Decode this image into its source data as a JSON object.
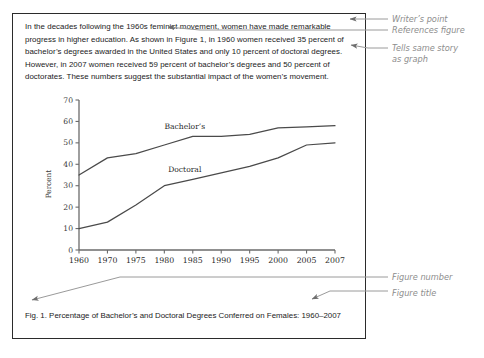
{
  "document": {
    "paragraph_lines": [
      "In the decades following the 1960s feminist movement, women have made remarkable",
      "progress in higher education.  As shown in Figure 1, in 1960 women received 35 percent of",
      "bachelor’s degrees awarded in the United States and only 10 percent of doctoral degrees.",
      "However, in 2007 women received 59 percent of bachelor’s degrees and 50 percent of",
      "doctorates.   These numbers suggest the substantial impact of the women’s movement."
    ],
    "caption": "Fig. 1.  Percentage of Bachelor’s and Doctoral Degrees Conferred on Females: 1960–2007",
    "figure_number": "Fig. 1.",
    "figure_title": "Percentage of Bachelor’s and Doctoral Degrees Conferred on Females: 1960–2007"
  },
  "annotations": [
    {
      "id": "writers-point",
      "text": "Writer’s point"
    },
    {
      "id": "references-figure",
      "text": "References figure"
    },
    {
      "id": "tells-same-story",
      "text": "Tells same story"
    },
    {
      "id": "as-graph",
      "text": "as graph"
    },
    {
      "id": "figure-number",
      "text": "Figure number"
    },
    {
      "id": "figure-title",
      "text": "Figure title"
    }
  ],
  "chart_data": {
    "type": "line",
    "title": "",
    "xlabel": "",
    "ylabel": "Percent",
    "categories": [
      "1960",
      "1970",
      "1975",
      "1980",
      "1985",
      "1990",
      "1995",
      "2000",
      "2005",
      "2007"
    ],
    "ylim": [
      0,
      70
    ],
    "yticks": [
      0,
      10,
      20,
      30,
      40,
      50,
      60,
      70
    ],
    "grid": false,
    "legend_position": "inline-labels",
    "series": [
      {
        "name": "Bachelor’s",
        "values": [
          35,
          43,
          45,
          49,
          53,
          53,
          54,
          57,
          57.5,
          58
        ],
        "label": "Bachelor’s",
        "color": "#4a4a4a"
      },
      {
        "name": "Doctoral",
        "values": [
          10,
          13,
          21,
          30,
          33,
          36,
          39,
          43,
          49,
          50
        ],
        "label": "Doctoral",
        "color": "#4a4a4a"
      }
    ]
  },
  "colors": {
    "panel_border": "#2b2b2b",
    "axis": "#6b6b6b",
    "line": "#4a4a4a",
    "annotation_text": "#8d8d8d",
    "leader_line": "#9a9a9a",
    "body_text": "#1b1b1b"
  }
}
